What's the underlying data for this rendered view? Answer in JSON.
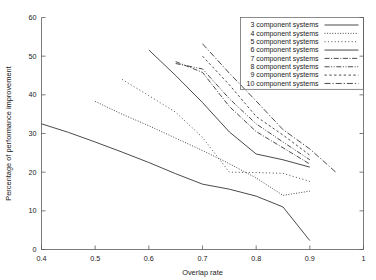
{
  "chart_data": {
    "type": "line",
    "title": "",
    "xlabel": "Overlap rate",
    "ylabel": "Percentage of performance improvement",
    "xlim": [
      0.4,
      1.0
    ],
    "ylim": [
      0,
      60
    ],
    "xticks": [
      0.4,
      0.5,
      0.6,
      0.7,
      0.8,
      0.9,
      1
    ],
    "xtick_labels": [
      "0.4",
      "0.5",
      "0.6",
      "0.7",
      "0.8",
      "0.9",
      "1"
    ],
    "yticks": [
      0,
      10,
      20,
      30,
      40,
      50,
      60
    ],
    "ytick_labels": [
      "0",
      "10",
      "20",
      "30",
      "40",
      "50",
      "60"
    ],
    "grid": false,
    "legend_position": "top-right",
    "series": [
      {
        "name": "3 component systems",
        "line_style": "solid",
        "dasharray": "none",
        "x": [
          0.4,
          0.45,
          0.5,
          0.55,
          0.6,
          0.65,
          0.7,
          0.75,
          0.8,
          0.85,
          0.9
        ],
        "y": [
          32.5,
          30.3,
          27.8,
          25.2,
          22.5,
          19.6,
          16.9,
          15.6,
          13.8,
          11.0,
          2.3
        ]
      },
      {
        "name": "4 component systems",
        "line_style": "dotted-fine",
        "dasharray": "1,1.6",
        "x": [
          0.5,
          0.55,
          0.6,
          0.65,
          0.7,
          0.75,
          0.8,
          0.85,
          0.9
        ],
        "y": [
          38.3,
          35.0,
          32.0,
          28.8,
          25.6,
          22.2,
          18.5,
          14.0,
          15.1
        ]
      },
      {
        "name": "5 component systems",
        "line_style": "dotted-medium",
        "dasharray": "1,2.4",
        "x": [
          0.55,
          0.6,
          0.65,
          0.7,
          0.75,
          0.8,
          0.85,
          0.9
        ],
        "y": [
          44.0,
          39.8,
          35.5,
          29.0,
          20.0,
          19.9,
          19.7,
          17.6
        ]
      },
      {
        "name": "6 component systems",
        "line_style": "solid-light",
        "dasharray": "none",
        "x": [
          0.6,
          0.65,
          0.7,
          0.75,
          0.8,
          0.85,
          0.9
        ],
        "y": [
          51.6,
          45.0,
          38.0,
          30.4,
          24.7,
          23.2,
          21.3
        ]
      },
      {
        "name": "7 component systems",
        "line_style": "dash-dot",
        "dasharray": "5,1.6,1,1.6",
        "x": [
          0.65,
          0.7,
          0.75,
          0.8,
          0.85,
          0.9
        ],
        "y": [
          48.6,
          45.8,
          37.0,
          30.5,
          26.3,
          22.1
        ]
      },
      {
        "name": "8 component systems",
        "line_style": "dash-dot-long",
        "dasharray": "5,1.6,1,1.6,1,1.6",
        "x": [
          0.65,
          0.7,
          0.75,
          0.8,
          0.85,
          0.9
        ],
        "y": [
          48.1,
          46.7,
          39.0,
          32.5,
          27.8,
          23.2
        ]
      },
      {
        "name": "9 component systems",
        "line_style": "dashed-sparse",
        "dasharray": "2.4,2.4",
        "x": [
          0.7,
          0.75,
          0.8,
          0.85,
          0.9
        ],
        "y": [
          50.0,
          42.6,
          34.4,
          29.6,
          24.4
        ]
      },
      {
        "name": "10 component systems",
        "line_style": "dash-long",
        "dasharray": "6,2,1.2,2",
        "x": [
          0.7,
          0.75,
          0.8,
          0.85,
          0.9,
          0.95
        ],
        "y": [
          53.2,
          45.6,
          38.4,
          31.0,
          26.0,
          19.8
        ]
      }
    ]
  },
  "legend": {
    "items": [
      {
        "label": "3 component systems"
      },
      {
        "label": "4 component systems"
      },
      {
        "label": "5 component systems"
      },
      {
        "label": "6 component systems"
      },
      {
        "label": "7 component systems"
      },
      {
        "label": "8 component systems"
      },
      {
        "label": "9 component systems"
      },
      {
        "label": "10 component systems"
      }
    ]
  },
  "colors": {
    "axis": "#5a5a5a",
    "line": "#2b2b2b",
    "line_light": "#8a8a8a",
    "text": "#1a1a1a",
    "background": "#ffffff"
  }
}
